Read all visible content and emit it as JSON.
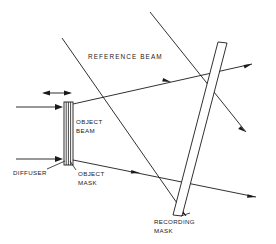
{
  "figure": {
    "kind": "optical-holography-setup-diagram",
    "background_color": "#ffffff",
    "line_color": "#1a1a1a",
    "width": 276,
    "height": 244
  },
  "labels": {
    "reference_beam": "REFERENCE BEAM",
    "object_beam_line1": "OBJECT",
    "object_beam_line2": "BEAM",
    "diffuser": "DIFFUSER",
    "object_mask_line1": "OBJECT",
    "object_mask_line2": "MASK",
    "recording_mask_line1": "RECORDING",
    "recording_mask_line2": "MASK"
  },
  "components": {
    "diffuser_object_mask_stack": {
      "name": "diffuser and object mask assembly",
      "shape": "vertical multi-layer plate",
      "x": 64,
      "y": 102,
      "width": 9,
      "height": 63,
      "layers": 4
    },
    "recording_mask_plate": {
      "name": "recording mask plate",
      "shape": "tilted rectangle",
      "top_center_x": 222,
      "top_y": 42,
      "bottom_center_x": 177,
      "bottom_y": 215,
      "thickness": 9
    }
  },
  "beams": {
    "reference_beam_rays": [
      {
        "name": "reference ray upper",
        "x1": 62,
        "y1": 38,
        "x2": 186,
        "y2": 215
      },
      {
        "name": "reference ray lower",
        "x1": 150,
        "y1": 12,
        "x2": 244,
        "y2": 130
      }
    ],
    "illumination_rays": [
      {
        "name": "upper illumination into diffuser",
        "x1": 16,
        "y1": 107,
        "x2": 63,
        "y2": 107
      },
      {
        "name": "lower illumination into diffuser",
        "x1": 16,
        "y1": 159,
        "x2": 63,
        "y2": 159
      }
    ],
    "object_beam_rays": [
      {
        "name": "object ray upper",
        "x1": 73,
        "y1": 104,
        "x2": 250,
        "y2": 65
      },
      {
        "name": "object ray lower",
        "x1": 73,
        "y1": 160,
        "x2": 255,
        "y2": 196
      }
    ],
    "width_measure": {
      "name": "assembly thickness double arrow",
      "x1": 42,
      "y1": 93,
      "x2": 72,
      "y2": 93
    }
  },
  "leader_lines": {
    "diffuser_leader": {
      "x1": 46,
      "y1": 170,
      "x2": 66,
      "y2": 162
    },
    "object_mask_leader": {
      "x1": 77,
      "y1": 169,
      "x2": 70,
      "y2": 161
    }
  }
}
